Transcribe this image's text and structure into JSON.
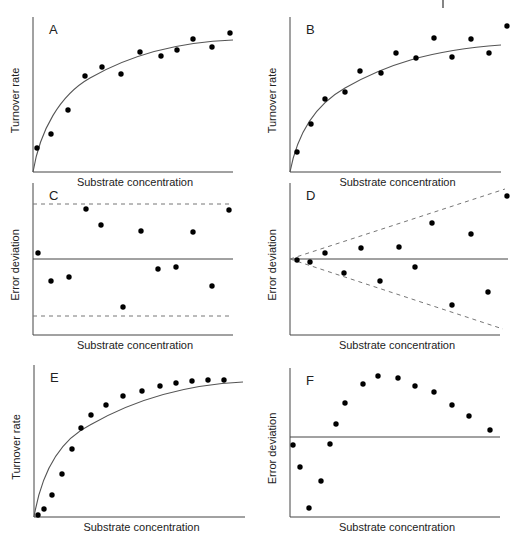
{
  "chart_data": [
    {
      "panel": "A",
      "type": "scatter",
      "title": "A",
      "xlabel": "Substrate concentration",
      "ylabel": "Turnover rate",
      "fit": "hyperbolic (Michaelis-Menten) curve",
      "axes_px": {
        "x0": 33,
        "y0": 172,
        "x1": 233,
        "ytop": 17
      },
      "points_px": [
        [
          37,
          148
        ],
        [
          51,
          134
        ],
        [
          68,
          110
        ],
        [
          85,
          76
        ],
        [
          102,
          67
        ],
        [
          121,
          74
        ],
        [
          140,
          52
        ],
        [
          161,
          56
        ],
        [
          177,
          50
        ],
        [
          193,
          39
        ],
        [
          212,
          47
        ],
        [
          230,
          33
        ]
      ],
      "curve_px": "M33,172 C40,130 60,95 90,78 C130,55 180,42 233,40",
      "grid": false
    },
    {
      "panel": "B",
      "type": "scatter",
      "title": "B",
      "xlabel": "Substrate concentration",
      "ylabel": "Turnover rate",
      "fit": "hyperbolic curve",
      "axes_px": {
        "x0": 290,
        "y0": 172,
        "x1": 501,
        "ytop": 17
      },
      "points_px": [
        [
          297,
          152
        ],
        [
          311,
          124
        ],
        [
          325,
          99
        ],
        [
          345,
          92
        ],
        [
          360,
          71
        ],
        [
          381,
          73
        ],
        [
          396,
          53
        ],
        [
          416,
          58
        ],
        [
          434,
          38
        ],
        [
          452,
          57
        ],
        [
          471,
          39
        ],
        [
          489,
          53
        ],
        [
          507,
          26
        ]
      ],
      "curve_px": "M290,172 C297,135 315,105 345,88 C385,65 430,50 501,45",
      "grid": false
    },
    {
      "panel": "C",
      "type": "scatter",
      "title": "C",
      "xlabel": "Substrate concentration",
      "ylabel": "Error deviation",
      "description": "Residuals randomly scattered within constant bounds",
      "axes_px": {
        "x0": 33,
        "y0": 335,
        "x1": 233,
        "ytop": 183
      },
      "zero_line_y": 259,
      "dashed_bounds_px": [
        [
          33,
          204,
          233,
          204
        ],
        [
          33,
          316,
          233,
          316
        ]
      ],
      "points_px": [
        [
          38,
          253
        ],
        [
          51,
          281
        ],
        [
          69,
          277
        ],
        [
          86,
          209
        ],
        [
          101,
          225
        ],
        [
          123,
          307
        ],
        [
          141,
          231
        ],
        [
          158,
          269
        ],
        [
          176,
          267
        ],
        [
          193,
          232
        ],
        [
          212,
          286
        ],
        [
          229,
          210
        ]
      ],
      "grid": false
    },
    {
      "panel": "D",
      "type": "scatter",
      "title": "D",
      "xlabel": "Substrate concentration",
      "ylabel": "Error deviation",
      "description": "Residuals fanning out with increasing concentration",
      "axes_px": {
        "x0": 290,
        "y0": 335,
        "x1": 500,
        "ytop": 183
      },
      "zero_line_y": 259,
      "zero_line_x_end": 508,
      "dashed_bounds_px": [
        [
          290,
          259,
          505,
          189
        ],
        [
          290,
          259,
          503,
          329
        ]
      ],
      "points_px": [
        [
          297,
          260
        ],
        [
          310,
          262
        ],
        [
          325,
          253
        ],
        [
          344,
          273
        ],
        [
          361,
          248
        ],
        [
          380,
          281
        ],
        [
          399,
          247
        ],
        [
          415,
          267
        ],
        [
          432,
          223
        ],
        [
          452,
          305
        ],
        [
          471,
          234
        ],
        [
          488,
          292
        ],
        [
          507,
          196
        ]
      ],
      "grid": false
    },
    {
      "panel": "E",
      "type": "scatter",
      "title": "E",
      "xlabel": "Substrate concentration",
      "ylabel": "Turnover rate",
      "description": "Sigmoidal data systematically deviating from hyperbolic fit",
      "axes_px": {
        "x0": 34,
        "y0": 517,
        "x1": 245,
        "ytop": 365
      },
      "points_px": [
        [
          38,
          515
        ],
        [
          44,
          509
        ],
        [
          52,
          495
        ],
        [
          62,
          474
        ],
        [
          72,
          449
        ],
        [
          81,
          428
        ],
        [
          91,
          415
        ],
        [
          106,
          405
        ],
        [
          123,
          396
        ],
        [
          142,
          391
        ],
        [
          160,
          386
        ],
        [
          176,
          383
        ],
        [
          192,
          381
        ],
        [
          208,
          380
        ],
        [
          224,
          380
        ]
      ],
      "curve_px": "M34,517 C42,470 60,440 90,425 C130,402 180,385 243,382",
      "grid": false
    },
    {
      "panel": "F",
      "type": "scatter",
      "title": "F",
      "xlabel": "Substrate concentration",
      "ylabel": "Error deviation",
      "description": "Systematic (non-random) residual pattern",
      "axes_px": {
        "x0": 290,
        "y0": 517,
        "x1": 500,
        "ytop": 368
      },
      "zero_line_y": 437,
      "points_px": [
        [
          293,
          445
        ],
        [
          300,
          467
        ],
        [
          309,
          508
        ],
        [
          321,
          481
        ],
        [
          330,
          444
        ],
        [
          336,
          424
        ],
        [
          345,
          403
        ],
        [
          363,
          384
        ],
        [
          378,
          376
        ],
        [
          398,
          378
        ],
        [
          415,
          386
        ],
        [
          434,
          392
        ],
        [
          452,
          405
        ],
        [
          469,
          416
        ],
        [
          490,
          430
        ]
      ],
      "grid": false
    }
  ],
  "labels": {
    "xlabel": "Substrate concentration",
    "ylabel_rate": "Turnover rate",
    "ylabel_error": "Error deviation",
    "panels": [
      "A",
      "B",
      "C",
      "D",
      "E",
      "F"
    ]
  }
}
